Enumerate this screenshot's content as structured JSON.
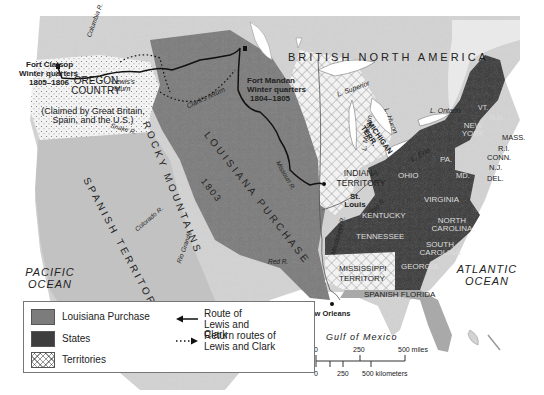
{
  "colors": {
    "louisiana_purchase": "#7c7c7c",
    "states": "#3e3e3e",
    "territories_hatch": "#9a9a9a",
    "land": "#cfcfcf",
    "water": "#ffffff",
    "route": "#111111"
  },
  "regions": {
    "british_north_america": "BRITISH NORTH AMERICA",
    "oregon_country": "OREGON COUNTRY",
    "oregon_claim": "(Claimed by Great Britain, Spain, and the U.S.)",
    "spanish_territory": "SPANISH TERRITORY",
    "rocky_mountains": "ROCKY MOUNTAINS",
    "louisiana_purchase": "LOUISIANA PURCHASE",
    "louisiana_year": "1803",
    "indiana_territory": "INDIANA TERRITORY",
    "michigan_terr": "MICHIGAN TERR.",
    "mississippi_territory": "MISSISSIPPI TERRITORY",
    "spanish_florida": "SPANISH FLORIDA"
  },
  "states": [
    "VT.",
    "N.H.",
    "NEW YORK",
    "MASS.",
    "R.I.",
    "CONN.",
    "N.J.",
    "DEL.",
    "MD.",
    "PA.",
    "OHIO",
    "VIRGINIA",
    "KENTUCKY",
    "TENNESSEE",
    "NORTH CAROLINA",
    "SOUTH CAROLINA",
    "GEORGIA"
  ],
  "places": {
    "fort_clatsop": [
      "Fort Clatsop",
      "Winter quarters",
      "1805–1806"
    ],
    "fort_mandan": [
      "Fort Mandan",
      "Winter quarters",
      "1804–1805"
    ],
    "st_louis": "St. Louis",
    "new_orleans": "New Orleans"
  },
  "water": {
    "pacific": "PACIFIC OCEAN",
    "atlantic": "ATLANTIC OCEAN",
    "gulf": "Gulf of Mexico",
    "lakes": [
      "L. Superior",
      "L. Michigan",
      "L. Huron",
      "L. Erie",
      "L. Ontario"
    ],
    "rivers": [
      "Columbia R.",
      "Snake R.",
      "Missouri R.",
      "Mississippi R.",
      "Ohio R.",
      "Red R.",
      "Colorado R.",
      "Rio Grande"
    ]
  },
  "route_notes": {
    "lewis_return": "Lewis's return",
    "clark_return": "Clark's return"
  },
  "legend": {
    "items": [
      {
        "label": "Louisiana Purchase",
        "swatch": "louisiana_purchase"
      },
      {
        "label": "States",
        "swatch": "states"
      },
      {
        "label": "Territories",
        "swatch": "territories"
      }
    ],
    "route": "Route of Lewis and Clark",
    "return_routes": "Return routes of Lewis and Clark"
  },
  "scale": {
    "miles_ticks": [
      "0",
      "250",
      "500 miles"
    ],
    "km_ticks": [
      "0",
      "250",
      "500 kilometers"
    ]
  }
}
